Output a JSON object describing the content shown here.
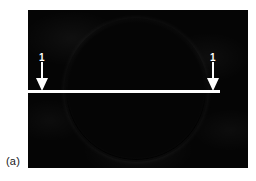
{
  "figure": {
    "panel_label": "(a)",
    "image_type": "grayscale-interferogram",
    "background_color": "#050505",
    "feature_color": "#ffffff"
  },
  "annotations": {
    "scan_line": {
      "name": "profile-line-1",
      "label": "1",
      "orientation": "horizontal",
      "color": "#ffffff"
    },
    "markers": [
      {
        "label": "1",
        "side": "left",
        "direction": "down",
        "color": "#ffffff"
      },
      {
        "label": "1",
        "side": "right",
        "direction": "down",
        "color": "#ffffff"
      }
    ]
  },
  "chart_data": {
    "type": "heatmap",
    "title": "",
    "xlabel": "",
    "ylabel": "",
    "series": [
      {
        "name": "annulus",
        "shape": "circle",
        "center": [
          0.5,
          0.5
        ],
        "outer_radius_frac": 0.5,
        "inner_radius_frac": 0.36,
        "peak_intensity": 255,
        "background_intensity": 5
      }
    ],
    "annotations": [
      {
        "text": "1",
        "x_frac": 0.06,
        "y_frac": 0.28
      },
      {
        "text": "1",
        "x_frac": 0.84,
        "y_frac": 0.28
      },
      {
        "text": "(a)",
        "x_frac": -0.1,
        "y_frac": 0.92
      }
    ],
    "grid": false,
    "legend": "none"
  }
}
